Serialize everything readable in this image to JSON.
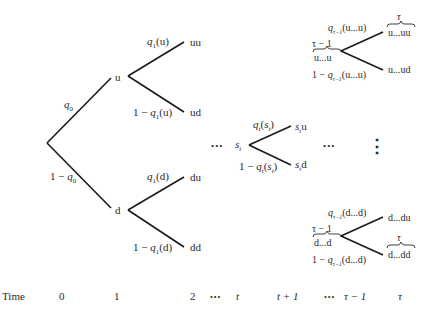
{
  "diagram": {
    "type": "binomial-tree",
    "root": {
      "up_prob": "q",
      "up_prob_sub": "0",
      "down_prob_prefix": "1 − ",
      "down_prob": "q",
      "down_prob_sub": "0"
    },
    "level1": {
      "u": {
        "label": "u",
        "up_prob": "q",
        "up_sub": "1",
        "up_arg": "(u)",
        "down_prefix": "1 − ",
        "down_prob": "q",
        "down_sub": "1",
        "down_arg": "(u)",
        "up_child": "uu",
        "down_child": "ud"
      },
      "d": {
        "label": "d",
        "up_prob": "q",
        "up_sub": "1",
        "up_arg": "(d)",
        "down_prefix": "1 − ",
        "down_prob": "q",
        "down_sub": "1",
        "down_arg": "(d)",
        "up_child": "du",
        "down_child": "dd"
      }
    },
    "middle": {
      "node": "s",
      "node_sub": "t",
      "up_prob": "q",
      "up_sub": "t",
      "up_arg_open": "(",
      "up_arg": "s",
      "up_arg_sub": "t",
      "up_arg_close": ")",
      "down_prefix": "1 − ",
      "down_prob": "q",
      "down_sub": "t",
      "down_arg_open": "(",
      "down_arg": "s",
      "down_arg_sub": "t",
      "down_arg_close": ")",
      "up_child_s": "s",
      "up_child_sub": "t",
      "up_child_suffix": "u",
      "down_child_s": "s",
      "down_child_sub": "t",
      "down_child_suffix": "d"
    },
    "top_right": {
      "node_brace_label": "τ − 1",
      "node": "u...u",
      "up_prob": "q",
      "up_sub": "τ−1",
      "up_arg": "(u...u)",
      "down_prefix": "1 − ",
      "down_prob": "q",
      "down_sub": "τ−1",
      "down_arg": "(u...u)",
      "up_child_brace_label": "τ",
      "up_child": "u...uu",
      "down_child": "u...ud"
    },
    "bottom_right": {
      "node_brace_label": "τ − 1",
      "node": "d...d",
      "up_prob": "q",
      "up_sub": "τ−1",
      "up_arg": "(d...d)",
      "down_prefix": "1 − ",
      "down_prob": "q",
      "down_sub": "τ−1",
      "down_arg": "(d...d)",
      "up_child": "d...du",
      "down_child_brace_label": "τ",
      "down_child": "d...dd"
    },
    "ellipses": {
      "horizontal": "•••",
      "vertical": "⋮"
    }
  },
  "time_axis": {
    "label": "Time",
    "ticks": [
      "0",
      "1",
      "2",
      "•••",
      "t",
      "t + 1",
      "•••",
      "τ − 1",
      "τ"
    ]
  }
}
